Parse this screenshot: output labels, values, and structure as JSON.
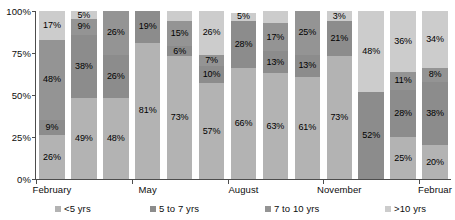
{
  "chart_data": {
    "type": "bar",
    "subtype": "stacked-percentage-column",
    "title": "",
    "subtitle": "",
    "xlabel": "",
    "ylabel": "",
    "ylim": [
      0,
      100
    ],
    "ytick_labels": [
      "0%",
      "25%",
      "50%",
      "75%",
      "100%"
    ],
    "ytick_values": [
      0,
      25,
      50,
      75,
      100
    ],
    "grid": false,
    "legend_position": "bottom",
    "categories": [
      "February",
      "",
      "",
      "May",
      "",
      "",
      "August",
      "",
      "",
      "November",
      "",
      "",
      "Februar"
    ],
    "x_axis_tick_labels": [
      "February",
      "May",
      "August",
      "November",
      "Februar"
    ],
    "series": [
      {
        "name": "<5 yrs",
        "color": "#b3b3b3",
        "values": [
          26,
          49,
          48,
          81,
          73,
          57,
          66,
          63,
          61,
          73,
          52,
          25,
          20
        ]
      },
      {
        "name": "5 to 7 yrs",
        "color": "#8c8c8c",
        "values": [
          9,
          38,
          26,
          0,
          6,
          10,
          0,
          13,
          13,
          21,
          48,
          28,
          38
        ]
      },
      {
        "name": "7 to 10 yrs",
        "color": "#949494",
        "values": [
          48,
          9,
          26,
          19,
          6,
          7,
          28,
          17,
          26,
          3,
          0,
          11,
          8
        ]
      },
      {
        "name": ">10 yrs",
        "color": "#cccccc",
        "values": [
          17,
          5,
          0,
          0,
          15,
          26,
          5,
          7,
          0,
          3,
          0,
          36,
          34
        ]
      }
    ],
    "bars": [
      {
        "index": 0,
        "category": "February",
        "segments": [
          {
            "series": "<5 yrs",
            "value": 26,
            "label": "26%",
            "color": "#b3b3b3"
          },
          {
            "series": "5 to 7 yrs",
            "value": 9,
            "label": "9%",
            "color": "#8c8c8c"
          },
          {
            "series": "7 to 10 yrs",
            "value": 48,
            "label": "48%",
            "color": "#949494"
          },
          {
            "series": ">10 yrs",
            "value": 17,
            "label": "17%",
            "color": "#cccccc"
          }
        ]
      },
      {
        "index": 1,
        "category": "",
        "segments": [
          {
            "series": "<5 yrs",
            "value": 48,
            "label": "49%",
            "color": "#b3b3b3"
          },
          {
            "series": "5 to 7 yrs",
            "value": 38,
            "label": "38%",
            "color": "#8c8c8c"
          },
          {
            "series": "7 to 10 yrs",
            "value": 9,
            "label": "9%",
            "color": "#949494"
          },
          {
            "series": ">10 yrs",
            "value": 5,
            "label": "5%",
            "color": "#cccccc"
          }
        ]
      },
      {
        "index": 2,
        "category": "",
        "segments": [
          {
            "series": "<5 yrs",
            "value": 48,
            "label": "48%",
            "color": "#b3b3b3"
          },
          {
            "series": "5 to 7 yrs",
            "value": 26,
            "label": "26%",
            "color": "#8c8c8c"
          },
          {
            "series": "7 to 10 yrs",
            "value": 26,
            "label": "26%",
            "color": "#949494"
          }
        ]
      },
      {
        "index": 3,
        "category": "May",
        "segments": [
          {
            "series": "<5 yrs",
            "value": 81,
            "label": "81%",
            "color": "#b3b3b3"
          },
          {
            "series": "7 to 10 yrs",
            "value": 19,
            "label": "19%",
            "color": "#8c8c8c"
          }
        ]
      },
      {
        "index": 4,
        "category": "",
        "segments": [
          {
            "series": "<5 yrs",
            "value": 73,
            "label": "73%",
            "color": "#b3b3b3"
          },
          {
            "series": "5 to 7 yrs",
            "value": 6,
            "label": "6%",
            "color": "#8c8c8c"
          },
          {
            "series": "7 to 10 yrs",
            "value": 15,
            "label": "15%",
            "color": "#949494"
          },
          {
            "series": ">10 yrs",
            "value": 6,
            "label": "",
            "color": "#cccccc"
          }
        ]
      },
      {
        "index": 5,
        "category": "",
        "segments": [
          {
            "series": "<5 yrs",
            "value": 57,
            "label": "57%",
            "color": "#b3b3b3"
          },
          {
            "series": "5 to 7 yrs",
            "value": 10,
            "label": "10%",
            "color": "#8c8c8c"
          },
          {
            "series": "7 to 10 yrs",
            "value": 7,
            "label": "7%",
            "color": "#949494"
          },
          {
            "series": ">10 yrs",
            "value": 26,
            "label": "26%",
            "color": "#cccccc"
          }
        ]
      },
      {
        "index": 6,
        "category": "August",
        "segments": [
          {
            "series": "<5 yrs",
            "value": 66,
            "label": "66%",
            "color": "#b3b3b3"
          },
          {
            "series": "7 to 10 yrs",
            "value": 28,
            "label": "28%",
            "color": "#8c8c8c"
          },
          {
            "series": ">10 yrs",
            "value": 5,
            "label": "5%",
            "color": "#cccccc"
          }
        ]
      },
      {
        "index": 7,
        "category": "",
        "segments": [
          {
            "series": "<5 yrs",
            "value": 63,
            "label": "63%",
            "color": "#b3b3b3"
          },
          {
            "series": "5 to 7 yrs",
            "value": 13,
            "label": "13%",
            "color": "#8c8c8c"
          },
          {
            "series": "7 to 10 yrs",
            "value": 17,
            "label": "17%",
            "color": "#949494"
          },
          {
            "series": ">10 yrs",
            "value": 7,
            "label": "",
            "color": "#cccccc"
          }
        ]
      },
      {
        "index": 8,
        "category": "",
        "segments": [
          {
            "series": "<5 yrs",
            "value": 61,
            "label": "61%",
            "color": "#b3b3b3"
          },
          {
            "series": "5 to 7 yrs",
            "value": 13,
            "label": "13%",
            "color": "#8c8c8c"
          },
          {
            "series": "7 to 10 yrs",
            "value": 26,
            "label": "25%",
            "color": "#949494"
          }
        ]
      },
      {
        "index": 9,
        "category": "November",
        "segments": [
          {
            "series": "<5 yrs",
            "value": 73,
            "label": "73%",
            "color": "#b3b3b3"
          },
          {
            "series": "5 to 7 yrs",
            "value": 21,
            "label": "21%",
            "color": "#8c8c8c"
          },
          {
            "series": ">10 yrs",
            "value": 6,
            "label": "3%",
            "color": "#cccccc"
          }
        ]
      },
      {
        "index": 10,
        "category": "",
        "segments": [
          {
            "series": "5 to 7 yrs",
            "value": 52,
            "label": "52%",
            "color": "#8c8c8c"
          },
          {
            "series": ">10 yrs",
            "value": 48,
            "label": "48%",
            "color": "#cccccc"
          }
        ]
      },
      {
        "index": 11,
        "category": "",
        "segments": [
          {
            "series": "<5 yrs",
            "value": 25,
            "label": "25%",
            "color": "#b3b3b3"
          },
          {
            "series": "5 to 7 yrs",
            "value": 28,
            "label": "28%",
            "color": "#8c8c8c"
          },
          {
            "series": "7 to 10 yrs",
            "value": 11,
            "label": "11%",
            "color": "#949494"
          },
          {
            "series": ">10 yrs",
            "value": 36,
            "label": "36%",
            "color": "#cccccc"
          }
        ]
      },
      {
        "index": 12,
        "category": "Februar",
        "segments": [
          {
            "series": "<5 yrs",
            "value": 20,
            "label": "20%",
            "color": "#b3b3b3"
          },
          {
            "series": "5 to 7 yrs",
            "value": 38,
            "label": "38%",
            "color": "#8c8c8c"
          },
          {
            "series": "7 to 10 yrs",
            "value": 8,
            "label": "8%",
            "color": "#949494"
          },
          {
            "series": ">10 yrs",
            "value": 34,
            "label": "34%",
            "color": "#cccccc"
          }
        ]
      }
    ],
    "legend": [
      {
        "label": "<5 yrs",
        "color": "#b3b3b3"
      },
      {
        "label": "5 to 7 yrs",
        "color": "#8c8c8c"
      },
      {
        "label": "7 to 10 yrs",
        "color": "#949494"
      },
      {
        "label": ">10 yrs",
        "color": "#cccccc"
      }
    ]
  },
  "axis_color": "#4d4d4d",
  "background_color": "#ffffff"
}
